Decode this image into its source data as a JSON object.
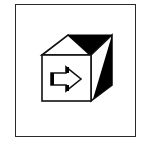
{
  "icon": {
    "name": "cube-with-arrow-icon",
    "description": "3D cube with right-pointing arrow on front face, inside a square frame",
    "colors": {
      "stroke": "#111111",
      "fill_dark": "#000000",
      "fill_light": "#ffffff",
      "frame": "#2a2a2a",
      "background": "#ffffff"
    }
  }
}
